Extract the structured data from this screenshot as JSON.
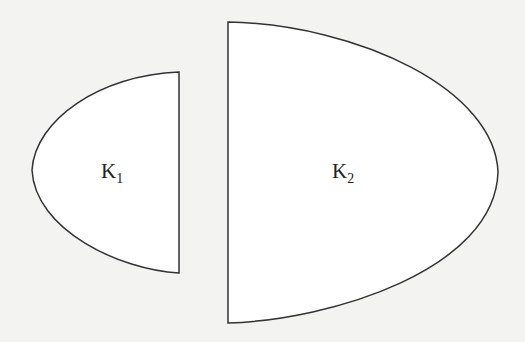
{
  "diagram": {
    "shapes": [
      {
        "id": "K1",
        "label": "K",
        "subscript": "1",
        "description": "left region: curved left boundary, straight vertical right edge"
      },
      {
        "id": "K2",
        "label": "K",
        "subscript": "2",
        "description": "right region: straight vertical left edge, curved right boundary"
      }
    ],
    "colors": {
      "background": "#f3f3f1",
      "stroke": "#333333",
      "fill": "#ffffff"
    }
  }
}
